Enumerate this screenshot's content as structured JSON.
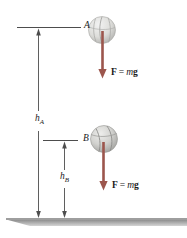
{
  "figure_name": "falling-ball-heights-diagram",
  "colors": {
    "background": "#ffffff",
    "line": "#4d4d4d",
    "force_arrow": "#9c564d",
    "text": "#1a1a1a",
    "ground": "#8f8f8f"
  },
  "points": {
    "a_label": "A",
    "b_label": "B"
  },
  "heights": {
    "h_symbol": "h",
    "a_subscript": "A",
    "b_subscript": "B"
  },
  "force": {
    "vector_symbol": "F",
    "equals": "=",
    "mass_symbol": "m",
    "gravity_symbol": "g"
  }
}
